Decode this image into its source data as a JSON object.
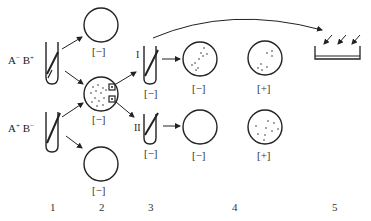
{
  "diagram": {
    "type": "replica-plating-experiment",
    "colors": {
      "line": "#222222",
      "text": "#222222"
    },
    "strains": [
      {
        "id": "strain-a-minus-b-plus",
        "a": "A",
        "a_sign": "−",
        "b": "B",
        "b_sign": "+"
      },
      {
        "id": "strain-a-plus-b-minus",
        "a": "A",
        "a_sign": "+",
        "b": "B",
        "b_sign": "−"
      }
    ],
    "tubes": {
      "tube_I_label": "I",
      "tube_II_label": "II",
      "tube_I_medium": "[−]",
      "tube_II_medium": "[−]"
    },
    "plates": {
      "step2_top": "[−]",
      "step2_middle": "[−]",
      "step2_bottom": "[−]",
      "step4_I_minimal": "[−]",
      "step4_I_complete": "[+]",
      "step4_II_minimal": "[−]",
      "step4_II_complete": "[+]"
    },
    "steps": [
      "1",
      "2",
      "3",
      "4",
      "5"
    ]
  }
}
